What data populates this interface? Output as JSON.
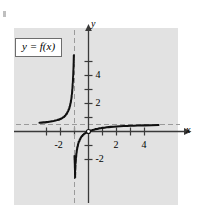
{
  "figure": {
    "plot_background_color": "#e2e2e2",
    "curve_color": "#111111",
    "axis_color": "#3a3a3a",
    "asymptote_color": "#9a9a9a",
    "label_box_text": "y = f(x)",
    "corner_mark": "tick-mark"
  },
  "chart_data": {
    "type": "line",
    "title": "",
    "subtitle": "",
    "xlabel": "x",
    "ylabel": "y",
    "xlim": [
      -3.5,
      5.0
    ],
    "ylim": [
      -3.2,
      5.4
    ],
    "grid": false,
    "legend_position": "upper-left",
    "legend_entries": [
      "y = f(x)"
    ],
    "x_ticks": [
      -3,
      -2,
      -1,
      1,
      2,
      3,
      4
    ],
    "x_tick_labels": [
      "",
      "-2",
      "",
      "",
      "2",
      "",
      "4"
    ],
    "y_ticks": [
      -2,
      -1,
      1,
      2,
      3,
      4,
      5
    ],
    "y_tick_labels": [
      "-2",
      "",
      "",
      "2",
      "",
      "4",
      ""
    ],
    "x_labeled_ticks": [
      {
        "value": -2,
        "label": "-2"
      },
      {
        "value": 2,
        "label": "2"
      },
      {
        "value": 4,
        "label": "4"
      }
    ],
    "y_labeled_ticks": [
      {
        "value": 4,
        "label": "4"
      },
      {
        "value": 2,
        "label": "2"
      },
      {
        "value": -2,
        "label": "-2"
      }
    ],
    "annotations": [
      {
        "text": "y = f(x)",
        "type": "boxed-label",
        "x": -2.9,
        "y": 4.3
      }
    ],
    "asymptotes": [
      {
        "type": "vertical",
        "value": -1.0,
        "style": "dashed"
      },
      {
        "type": "horizontal",
        "value": 0.5,
        "style": "dashed"
      }
    ],
    "features": {
      "passes_through_origin": true,
      "origin_marker": "open-point"
    },
    "series": [
      {
        "name": "left-branch",
        "description": "Branch left of the vertical asymptote x = -1; rises from just above y = 0.5 toward +infinity as x approaches -1 from the left.",
        "points": [
          [
            -3.5,
            0.62
          ],
          [
            -3.2,
            0.65
          ],
          [
            -3.0,
            0.67
          ],
          [
            -2.8,
            0.7
          ],
          [
            -2.6,
            0.73
          ],
          [
            -2.4,
            0.78
          ],
          [
            -2.2,
            0.83
          ],
          [
            -2.0,
            0.9
          ],
          [
            -1.9,
            0.95
          ],
          [
            -1.8,
            1.02
          ],
          [
            -1.7,
            1.1
          ],
          [
            -1.6,
            1.22
          ],
          [
            -1.5,
            1.38
          ],
          [
            -1.42,
            1.55
          ],
          [
            -1.35,
            1.75
          ],
          [
            -1.3,
            1.95
          ],
          [
            -1.25,
            2.2
          ],
          [
            -1.2,
            2.55
          ],
          [
            -1.16,
            2.95
          ],
          [
            -1.13,
            3.35
          ],
          [
            -1.1,
            3.85
          ],
          [
            -1.08,
            4.3
          ],
          [
            -1.06,
            4.8
          ],
          [
            -1.05,
            5.2
          ],
          [
            -1.045,
            5.45
          ]
        ]
      },
      {
        "name": "right-branch",
        "description": "Branch right of the vertical asymptote x = -1; rises from -infinity, passes through the origin, and flattens toward the horizontal asymptote y = 0.5.",
        "points": [
          [
            -0.955,
            -3.3
          ],
          [
            -0.96,
            -3.0
          ],
          [
            -0.97,
            -2.55
          ],
          [
            -0.98,
            -2.2
          ],
          [
            -0.99,
            -1.95
          ],
          [
            -1.0,
            -1.75
          ],
          [
            -0.95,
            -2.9
          ],
          [
            -0.93,
            -2.4
          ],
          [
            -0.9,
            -1.95
          ],
          [
            -0.87,
            -1.62
          ],
          [
            -0.84,
            -1.38
          ],
          [
            -0.8,
            -1.15
          ],
          [
            -0.75,
            -0.93
          ],
          [
            -0.7,
            -0.76
          ],
          [
            -0.62,
            -0.57
          ],
          [
            -0.55,
            -0.44
          ],
          [
            -0.48,
            -0.34
          ],
          [
            -0.4,
            -0.25
          ],
          [
            -0.32,
            -0.18
          ],
          [
            -0.24,
            -0.12
          ],
          [
            -0.16,
            -0.07
          ],
          [
            -0.08,
            -0.03
          ],
          [
            0.0,
            0.0
          ],
          [
            0.15,
            0.06
          ],
          [
            0.3,
            0.11
          ],
          [
            0.5,
            0.17
          ],
          [
            0.75,
            0.22
          ],
          [
            1.0,
            0.26
          ],
          [
            1.3,
            0.3
          ],
          [
            1.6,
            0.33
          ],
          [
            2.0,
            0.36
          ],
          [
            2.5,
            0.39
          ],
          [
            3.0,
            0.41
          ],
          [
            3.5,
            0.43
          ],
          [
            4.0,
            0.44
          ],
          [
            4.5,
            0.45
          ],
          [
            5.0,
            0.46
          ]
        ]
      }
    ]
  }
}
